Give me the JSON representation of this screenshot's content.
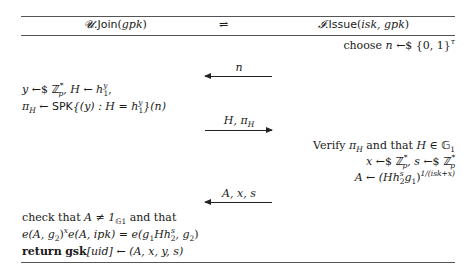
{
  "header": {
    "left": {
      "party": "𝓤",
      "proc": "Join",
      "args": "gpk"
    },
    "middle": "⇌",
    "right": {
      "party": "𝓘",
      "proc": "Issue",
      "args": "isk, gpk"
    }
  },
  "steps": [
    {
      "side": "issuer",
      "lines": [
        "choose n ←$ {0,1}^τ"
      ]
    },
    {
      "side": "message",
      "direction": "issuer-to-user",
      "label": "n"
    },
    {
      "side": "user",
      "lines": [
        "y ←$ ℤ*_p, H ← h_1^y,",
        "π_H ← SPK{(y) : H = h_1^y}(n)"
      ]
    },
    {
      "side": "message",
      "direction": "user-to-issuer",
      "label": "H, π_H"
    },
    {
      "side": "issuer",
      "lines": [
        "Verify π_H and that H ∈ 𝔾_1",
        "x ←$ ℤ*_p, s ←$ ℤ*_p",
        "A ← (H h_2^s g_1)^{1/(isk+x)}"
      ]
    },
    {
      "side": "message",
      "direction": "issuer-to-user",
      "label": "A, x, s"
    },
    {
      "side": "user",
      "lines": [
        "check that A ≠ 1_{𝔾_1} and that",
        "e(A, g_2)^x e(A, ipk) = e(g_1 H h_2^s, g_2)",
        "return gsk[uid] ← (A, x, y, s)"
      ]
    }
  ],
  "text": {
    "choose": "choose",
    "n": "n",
    "randfrom": "←$",
    "set01": "{0, 1}",
    "tau": "τ",
    "msg1": "n",
    "msg2_H": "H,",
    "msg2_pi": "π",
    "msg2_sub": "H",
    "msg3": "A, x, s",
    "u1_y": "y",
    "Zp": "ℤ",
    "star": "*",
    "p": "p",
    "u1_mid": ", H ← h",
    "one": "1",
    "y": "y",
    "comma": ",",
    "pi": "π",
    "H": "H",
    "larrow": " ← ",
    "spk": "SPK",
    "spk_body": "{(y) : H = h",
    "spk_tail": "}(n)",
    "verify": "Verify ",
    "and_that": " and that ",
    "in_G": "H ∈ ",
    "G": "𝔾",
    "x": "x",
    "s_sep": ", s",
    "A": "A",
    "Hh": "(Hh",
    "two": "2",
    "s": "s",
    "g1close": "g",
    "close": ")",
    "exp": "1/(isk+x)",
    "check": "check that ",
    "neq": "A ≠ 1",
    "and_that2": " and that",
    "pairing": "e(A, g",
    "pairing2": ")",
    "pairing3": "e(A, ipk) = e(g",
    "pairing4": "Hh",
    "pairing5": ", g",
    "pairing6": ")",
    "ret": "return",
    "gsk": "gsk",
    "uid": "[uid]",
    "ret_tail": " ← (A, x, y, s)"
  }
}
